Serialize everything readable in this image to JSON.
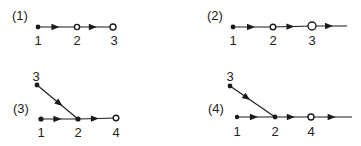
{
  "colors": {
    "ink": "#1a1a1a",
    "background": "#ffffff"
  },
  "panels": [
    {
      "label": "(1)",
      "label_pos": [
        12,
        9
      ],
      "nodes": [
        {
          "id": "1",
          "x": 38,
          "y": 27,
          "type": "filled",
          "r": 2.4,
          "label_pos": [
            38,
            34
          ]
        },
        {
          "id": "2",
          "x": 77,
          "y": 27,
          "type": "open",
          "r": 2.6,
          "label_pos": [
            77,
            34
          ]
        },
        {
          "id": "3",
          "x": 113,
          "y": 27,
          "type": "open",
          "r": 3.0,
          "label_pos": [
            114,
            34
          ]
        }
      ],
      "edges": [
        {
          "from": "1",
          "to": "2",
          "arrow_at": 0.55
        },
        {
          "from": "2",
          "to": "3",
          "arrow_at": 0.55
        }
      ],
      "tail": null
    },
    {
      "label": "(2)",
      "label_pos": [
        207,
        9
      ],
      "nodes": [
        {
          "id": "1",
          "x": 233,
          "y": 27,
          "type": "filled",
          "r": 2.4,
          "label_pos": [
            233,
            34
          ]
        },
        {
          "id": "2",
          "x": 273,
          "y": 27,
          "type": "open",
          "r": 2.8,
          "label_pos": [
            273,
            34
          ]
        },
        {
          "id": "3",
          "x": 312,
          "y": 26,
          "type": "open",
          "r": 4.0,
          "label_pos": [
            312,
            34
          ]
        }
      ],
      "edges": [
        {
          "from": "1",
          "to": "2",
          "arrow_at": 0.55
        },
        {
          "from": "2",
          "to": "3",
          "arrow_at": 0.55
        }
      ],
      "tail": {
        "from": "3",
        "x2": 347,
        "y2": 26,
        "arrow_at": 0.6
      }
    },
    {
      "label": "(3)",
      "label_pos": [
        13,
        102
      ],
      "nodes": [
        {
          "id": "3",
          "x": 37,
          "y": 85,
          "type": "filled",
          "r": 2.4,
          "label_pos": [
            36,
            70
          ]
        },
        {
          "id": "1",
          "x": 41,
          "y": 119,
          "type": "filled",
          "r": 2.6,
          "label_pos": [
            41,
            126
          ]
        },
        {
          "id": "2",
          "x": 78,
          "y": 119,
          "type": "filled",
          "r": 2.6,
          "label_pos": [
            78,
            126
          ]
        },
        {
          "id": "4",
          "x": 116,
          "y": 118,
          "type": "open",
          "r": 2.8,
          "label_pos": [
            116,
            126
          ]
        }
      ],
      "edges": [
        {
          "from": "3",
          "to": "2",
          "arrow_at": 0.62
        },
        {
          "from": "1",
          "to": "2",
          "arrow_at": 0.55
        },
        {
          "from": "2",
          "to": "4",
          "arrow_at": 0.55
        }
      ],
      "tail": null
    },
    {
      "label": "(4)",
      "label_pos": [
        208,
        102
      ],
      "nodes": [
        {
          "id": "3",
          "x": 230,
          "y": 86,
          "type": "filled",
          "r": 2.4,
          "label_pos": [
            230,
            70
          ]
        },
        {
          "id": "1",
          "x": 237,
          "y": 117,
          "type": "filled",
          "r": 2.2,
          "label_pos": [
            237,
            125
          ]
        },
        {
          "id": "2",
          "x": 275,
          "y": 117,
          "type": "filled",
          "r": 2.4,
          "label_pos": [
            275,
            125
          ]
        },
        {
          "id": "4",
          "x": 311,
          "y": 117,
          "type": "open",
          "r": 3.0,
          "label_pos": [
            311,
            125
          ]
        }
      ],
      "edges": [
        {
          "from": "3",
          "to": "2",
          "arrow_at": 0.45
        },
        {
          "from": "1",
          "to": "2",
          "arrow_at": 0.55
        },
        {
          "from": "2",
          "to": "4",
          "arrow_at": 0.55
        }
      ],
      "tail": {
        "from": "4",
        "x2": 352,
        "y2": 117,
        "arrow_at": 0.6
      }
    }
  ]
}
